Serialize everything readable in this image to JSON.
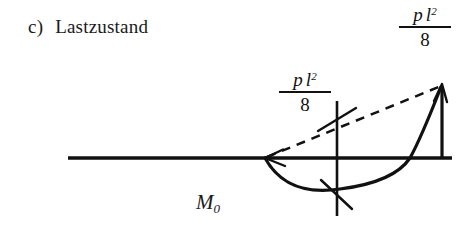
{
  "figure": {
    "caption": {
      "tag": "c)",
      "text": "Lastzustand"
    },
    "diagram_label": {
      "symbol": "M",
      "subscript": "0"
    },
    "annotations": [
      {
        "name": "midspan-moment",
        "numerator_p": "p",
        "numerator_l": "l",
        "numerator_exp": "2",
        "denominator": "8"
      },
      {
        "name": "support-moment",
        "numerator_p": "p",
        "numerator_l": "l",
        "numerator_exp": "2",
        "denominator": "8"
      }
    ],
    "colors": {
      "ink": "#111111",
      "background": "#ffffff"
    },
    "geometry": {
      "baseline_y": 158,
      "baseline_x_start": 68,
      "baseline_x_end": 452,
      "span_start_x": 265,
      "span_end_x": 442,
      "apex_y": 85,
      "parabola_min_y": 190,
      "ordinate_x": 337
    }
  }
}
